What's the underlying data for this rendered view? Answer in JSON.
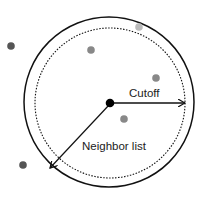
{
  "labels": {
    "cutoff": "Cutoff",
    "neighbor_list": "Neighbor list"
  },
  "colors": {
    "line": "#111111",
    "center": "#000000",
    "dark_particle": "#555555",
    "mid_particle": "#888888",
    "light_particle": "#bbbbbb"
  },
  "particles": [
    {
      "x": 11,
      "y": 46,
      "shade": "dark"
    },
    {
      "x": 91,
      "y": 50,
      "shade": "mid"
    },
    {
      "x": 139,
      "y": 27,
      "shade": "light"
    },
    {
      "x": 156,
      "y": 78,
      "shade": "mid"
    },
    {
      "x": 124,
      "y": 119,
      "shade": "mid"
    },
    {
      "x": 23,
      "y": 165,
      "shade": "dark"
    }
  ]
}
